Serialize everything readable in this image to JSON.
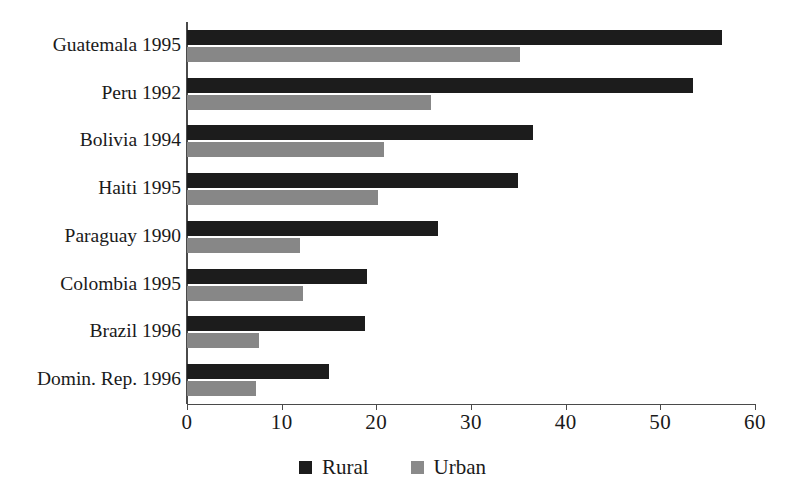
{
  "chart_data": {
    "type": "bar",
    "orientation": "horizontal",
    "title": "",
    "xlabel": "",
    "ylabel": "",
    "xlim": [
      0,
      60
    ],
    "xticks": [
      0,
      10,
      20,
      30,
      40,
      50,
      60
    ],
    "xtick_labels": [
      "0",
      "10",
      "20",
      "30",
      "40",
      "50",
      "60"
    ],
    "grid": false,
    "legend_position": "bottom-center",
    "categories": [
      "Guatemala 1995",
      "Peru 1992",
      "Bolivia 1994",
      "Haiti 1995",
      "Paraguay 1990",
      "Colombia 1995",
      "Brazil 1996",
      "Domin. Rep. 1996"
    ],
    "series": [
      {
        "name": "Rural",
        "color": "#1c1c1c",
        "values": [
          56.5,
          53.5,
          36.5,
          35.0,
          26.5,
          19.0,
          18.8,
          15.0
        ]
      },
      {
        "name": "Urban",
        "color": "#878787",
        "values": [
          35.2,
          25.8,
          20.8,
          20.2,
          11.9,
          12.3,
          7.6,
          7.3
        ]
      }
    ]
  },
  "legend": {
    "items": [
      {
        "label": "Rural",
        "swatch": "black-square-icon"
      },
      {
        "label": "Urban",
        "swatch": "gray-square-icon"
      }
    ]
  }
}
